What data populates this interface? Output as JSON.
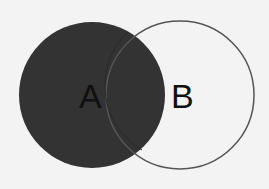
{
  "diagram": {
    "type": "venn",
    "sets": [
      {
        "label": "A",
        "fill": "#333333",
        "stroke": "#333333",
        "cx": 92,
        "cy": 95,
        "r": 73
      },
      {
        "label": "B",
        "fill": "none",
        "stroke": "#555555",
        "cx": 180,
        "cy": 95,
        "r": 74
      }
    ],
    "highlighted_region": "A"
  }
}
